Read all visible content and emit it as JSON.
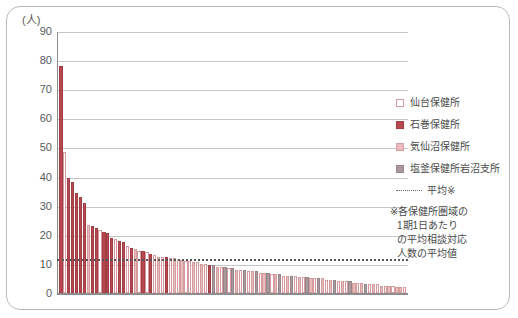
{
  "axis": {
    "unit_label": "(人)",
    "y_ticks": [
      90,
      80,
      70,
      60,
      50,
      40,
      30,
      20,
      10,
      0
    ],
    "y_min": 0,
    "y_max": 90
  },
  "legend": {
    "items": [
      {
        "label": "仙台保健所",
        "color": "#ffffff",
        "key": "sendai"
      },
      {
        "label": "石巻保健所",
        "color": "#b7484f",
        "key": "ishinomaki"
      },
      {
        "label": "気仙沼保健所",
        "color": "#e8bcbc",
        "key": "kesennuma"
      },
      {
        "label": "塩釜保健所岩沼支所",
        "color": "#a8999d",
        "key": "shiogama"
      }
    ],
    "average_label": "平均※"
  },
  "footnote": {
    "line1": "※各保健所圏域の",
    "line2": "1期1日あたり",
    "line3": "の平均相談対応",
    "line4": "人数の平均値"
  },
  "chart_data": {
    "type": "bar",
    "title": "",
    "xlabel": "",
    "ylabel": "(人)",
    "ylim": [
      0,
      90
    ],
    "grid": true,
    "legend_position": "right",
    "series_colors": {
      "sendai": "#ffffff",
      "ishinomaki": "#b7484f",
      "kesennuma": "#e8bcbc",
      "shiogama": "#a8999d"
    },
    "average_line": {
      "value": 12,
      "style": "dotted",
      "color": "#555555",
      "label": "平均※"
    },
    "values": [
      78,
      48.5,
      39.5,
      38,
      34.5,
      33,
      31,
      23.5,
      23,
      22.5,
      21.5,
      21,
      20.5,
      19,
      18.5,
      18,
      17.5,
      16,
      15.5,
      15,
      14.5,
      14.5,
      14,
      13.5,
      13,
      12.5,
      12.5,
      12.5,
      12,
      12,
      11.5,
      11.5,
      11,
      11,
      10.5,
      10.5,
      10,
      10,
      9.5,
      9.5,
      9,
      9,
      9,
      8.5,
      8.5,
      8,
      8,
      8,
      7.5,
      7.5,
      7.5,
      7,
      7,
      7,
      6.5,
      6.5,
      6.5,
      6,
      6,
      6,
      6,
      5.5,
      5.5,
      5.5,
      5,
      5,
      5,
      5,
      4.5,
      4.5,
      4.5,
      4,
      4,
      4,
      4,
      3.5,
      3.5,
      3.5,
      3,
      3,
      3,
      3,
      2.5,
      2.5,
      2.5,
      2.5,
      2,
      2,
      2
    ],
    "groups": [
      "ishinomaki",
      "sendai",
      "ishinomaki",
      "ishinomaki",
      "ishinomaki",
      "ishinomaki",
      "ishinomaki",
      "kesennuma",
      "ishinomaki",
      "ishinomaki",
      "sendai",
      "ishinomaki",
      "ishinomaki",
      "ishinomaki",
      "sendai",
      "ishinomaki",
      "ishinomaki",
      "sendai",
      "ishinomaki",
      "kesennuma",
      "sendai",
      "ishinomaki",
      "sendai",
      "ishinomaki",
      "sendai",
      "kesennuma",
      "sendai",
      "ishinomaki",
      "sendai",
      "kesennuma",
      "sendai",
      "kesennuma",
      "sendai",
      "sendai",
      "kesennuma",
      "sendai",
      "kesennuma",
      "sendai",
      "ishinomaki",
      "shiogama",
      "kesennuma",
      "sendai",
      "shiogama",
      "sendai",
      "shiogama",
      "kesennuma",
      "sendai",
      "shiogama",
      "sendai",
      "kesennuma",
      "shiogama",
      "sendai",
      "kesennuma",
      "shiogama",
      "sendai",
      "kesennuma",
      "shiogama",
      "sendai",
      "kesennuma",
      "shiogama",
      "sendai",
      "kesennuma",
      "sendai",
      "shiogama",
      "kesennuma",
      "sendai",
      "shiogama",
      "kesennuma",
      "sendai",
      "kesennuma",
      "shiogama",
      "sendai",
      "kesennuma",
      "sendai",
      "shiogama",
      "kesennuma",
      "sendai",
      "kesennuma",
      "shiogama",
      "sendai",
      "kesennuma",
      "sendai",
      "kesennuma",
      "sendai",
      "kesennuma",
      "sendai",
      "kesennuma",
      "kesennuma",
      "sendai"
    ],
    "categories_note": "sorted descending, unlabeled x-axis"
  }
}
